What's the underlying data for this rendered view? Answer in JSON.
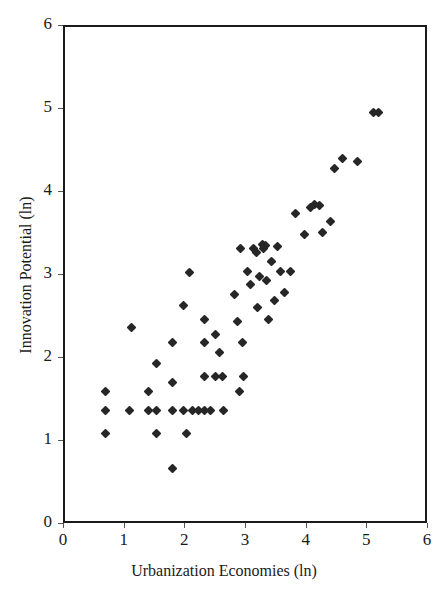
{
  "chart_data": {
    "type": "scatter",
    "title": "",
    "xlabel": "Urbanization Economies (ln)",
    "ylabel": "Innovation Potential (ln)",
    "xlim": [
      0,
      6
    ],
    "ylim": [
      0,
      6
    ],
    "xticks": [
      "0",
      "1",
      "2",
      "3",
      "4",
      "5",
      "6"
    ],
    "yticks": [
      "0",
      "1",
      "2",
      "3",
      "4",
      "5",
      "6"
    ],
    "grid": false,
    "legend": null,
    "marker": "diamond",
    "marker_color": "#262626",
    "series": [
      {
        "name": "cities",
        "points": [
          [
            0.66,
            1.61
          ],
          [
            0.66,
            1.38
          ],
          [
            0.66,
            1.1
          ],
          [
            1.07,
            1.38
          ],
          [
            1.1,
            2.38
          ],
          [
            1.37,
            1.61
          ],
          [
            1.37,
            1.38
          ],
          [
            1.5,
            1.95
          ],
          [
            1.5,
            1.38
          ],
          [
            1.5,
            1.1
          ],
          [
            1.78,
            2.2
          ],
          [
            1.78,
            1.72
          ],
          [
            1.78,
            1.38
          ],
          [
            1.78,
            0.68
          ],
          [
            1.95,
            2.64
          ],
          [
            1.95,
            1.38
          ],
          [
            2.0,
            1.1
          ],
          [
            2.05,
            3.04
          ],
          [
            2.1,
            1.38
          ],
          [
            2.2,
            1.38
          ],
          [
            2.3,
            1.38
          ],
          [
            2.4,
            1.38
          ],
          [
            2.3,
            2.48
          ],
          [
            2.3,
            2.2
          ],
          [
            2.3,
            1.79
          ],
          [
            2.48,
            1.79
          ],
          [
            2.48,
            2.3
          ],
          [
            2.55,
            2.08
          ],
          [
            2.6,
            1.79
          ],
          [
            2.62,
            1.38
          ],
          [
            2.8,
            2.78
          ],
          [
            2.85,
            2.45
          ],
          [
            2.88,
            1.61
          ],
          [
            2.9,
            3.33
          ],
          [
            2.92,
            2.2
          ],
          [
            2.95,
            1.79
          ],
          [
            3.0,
            3.05
          ],
          [
            3.05,
            2.9
          ],
          [
            3.1,
            3.33
          ],
          [
            3.15,
            3.28
          ],
          [
            3.18,
            2.62
          ],
          [
            3.2,
            3.0
          ],
          [
            3.25,
            3.38
          ],
          [
            3.28,
            3.33
          ],
          [
            3.3,
            3.37
          ],
          [
            3.32,
            2.95
          ],
          [
            3.35,
            2.48
          ],
          [
            3.4,
            3.18
          ],
          [
            3.45,
            2.7
          ],
          [
            3.5,
            3.35
          ],
          [
            3.55,
            3.05
          ],
          [
            3.62,
            2.8
          ],
          [
            3.72,
            3.05
          ],
          [
            3.8,
            3.75
          ],
          [
            3.95,
            3.5
          ],
          [
            4.05,
            3.82
          ],
          [
            4.12,
            3.86
          ],
          [
            4.2,
            3.85
          ],
          [
            4.25,
            3.52
          ],
          [
            4.38,
            3.66
          ],
          [
            4.45,
            4.3
          ],
          [
            4.58,
            4.42
          ],
          [
            4.82,
            4.38
          ],
          [
            5.08,
            4.97
          ],
          [
            5.16,
            4.97
          ]
        ]
      }
    ]
  }
}
